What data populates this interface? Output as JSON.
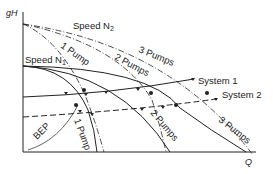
{
  "diagram": {
    "axes": {
      "y_label": "gH",
      "x_label": "Q"
    },
    "curve_labels": {
      "speed_n2": "Speed N",
      "speed_n2_sub": "2",
      "speed_n1": "Speed N",
      "speed_n1_sub": "1",
      "one_pump_top": "1 Pump",
      "two_pumps_top": "2 Pumps",
      "three_pumps_top": "3 Pumps",
      "one_pump_bottom": "1 Pump",
      "two_pumps_bottom": "2 Pumps",
      "three_pumps_bottom": "3 Pumps",
      "system1": "System 1",
      "system2": "System 2",
      "bep": "BEP"
    },
    "colors": {
      "line": "#222222",
      "background": "#ffffff"
    }
  }
}
